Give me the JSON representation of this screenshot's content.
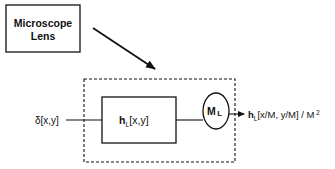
{
  "diagram": {
    "source_box": {
      "line1": "Microscope",
      "line2": "Lens"
    },
    "input_label": "δ[x,y]",
    "filter_box": {
      "symbol": "h",
      "subscript": "L",
      "args": "[x,y]"
    },
    "magnifier": {
      "symbol": "M",
      "subscript": "L"
    },
    "output_label": {
      "symbol": "h",
      "subscript": "L",
      "args": "[x/M, y/M] / M",
      "superscript": "2"
    },
    "colors": {
      "stroke": "#111111",
      "background": "#ffffff"
    }
  }
}
